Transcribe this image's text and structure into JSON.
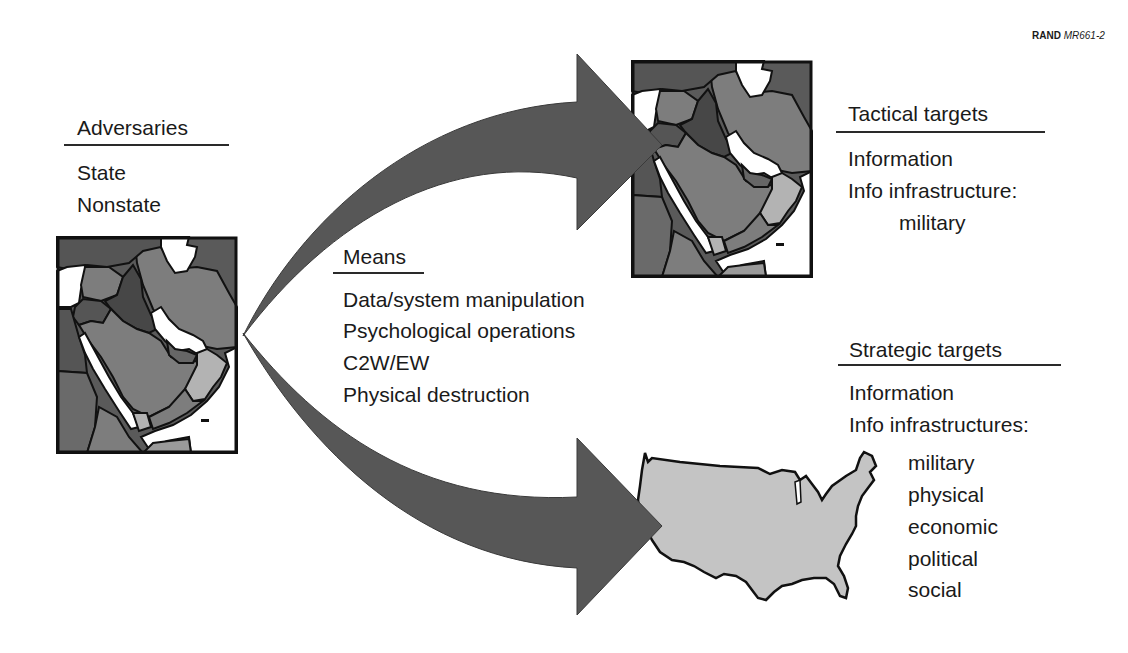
{
  "credit": {
    "org": "RAND",
    "doc_id": "MR661-2"
  },
  "adversaries": {
    "heading": "Adversaries",
    "items": [
      "State",
      "Nonstate"
    ]
  },
  "means": {
    "heading": "Means",
    "items": [
      "Data/system manipulation",
      "Psychological operations",
      "C2W/EW",
      "Physical destruction"
    ]
  },
  "tactical": {
    "heading": "Tactical targets",
    "items": [
      "Information",
      "Info infrastructure:"
    ],
    "subitems": [
      "military"
    ]
  },
  "strategic": {
    "heading": "Strategic targets",
    "items": [
      "Information",
      "Info infrastructures:"
    ],
    "subitems": [
      "military",
      "physical",
      "economic",
      "political",
      "social"
    ]
  },
  "figures": {
    "left_map": "middle-east-map",
    "top_right_map": "middle-east-map",
    "bottom_right_map": "united-states-map",
    "arrows": [
      "arrow-to-tactical-targets",
      "arrow-to-strategic-targets"
    ]
  },
  "colors": {
    "arrow": "#575757",
    "map_dark": "#5a5a5a",
    "map_darker": "#474747",
    "map_mid": "#7d7d7d",
    "map_light": "#b3b3b3",
    "usa_fill": "#c4c4c4",
    "outline": "#111111"
  }
}
